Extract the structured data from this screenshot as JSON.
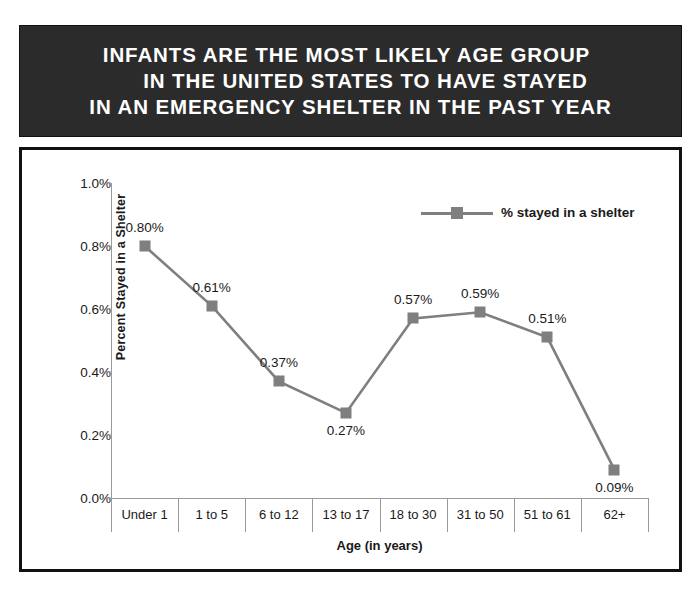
{
  "title": {
    "line1": "INFANTS ARE THE MOST LIKELY AGE GROUP",
    "line2": "IN THE UNITED STATES TO HAVE STAYED",
    "line3": "IN AN EMERGENCY SHELTER IN THE PAST YEAR",
    "background_color": "#2b2b2b",
    "text_color": "#ffffff"
  },
  "chart_data": {
    "type": "line",
    "title": "INFANTS ARE THE MOST LIKELY AGE GROUP IN THE UNITED STATES TO HAVE STAYED IN AN EMERGENCY SHELTER IN THE PAST YEAR",
    "xlabel": "Age (in years)",
    "ylabel": "Percent Stayed in a Shelter",
    "categories": [
      "Under 1",
      "1 to 5",
      "6 to 12",
      "13 to 17",
      "18 to 30",
      "31 to 50",
      "51 to 61",
      "62+"
    ],
    "values": [
      0.8,
      0.61,
      0.37,
      0.27,
      0.57,
      0.59,
      0.51,
      0.09
    ],
    "point_labels": [
      "0.80%",
      "0.61%",
      "0.37%",
      "0.27%",
      "0.57%",
      "0.59%",
      "0.51%",
      "0.09%"
    ],
    "label_positions": [
      "above",
      "above",
      "above",
      "below",
      "above",
      "above",
      "above",
      "below"
    ],
    "ylim": [
      0.0,
      1.0
    ],
    "ytick_values": [
      1.0,
      0.8,
      0.6,
      0.4,
      0.2,
      0.0
    ],
    "ytick_labels": [
      "1.0%",
      "0.8%",
      "0.6%",
      "0.4%",
      "0.2%",
      "0.0%"
    ],
    "grid": false,
    "legend_position": "top-right",
    "series": [
      {
        "name": "% stayed in a shelter",
        "values": [
          0.8,
          0.61,
          0.37,
          0.27,
          0.57,
          0.59,
          0.51,
          0.09
        ],
        "color": "#7f7f7f",
        "marker": "square"
      }
    ]
  },
  "legend": {
    "label": "% stayed in a shelter",
    "color": "#7f7f7f"
  },
  "colors": {
    "series": "#7f7f7f",
    "axis": "#9a9a9a",
    "frame": "#111111",
    "text": "#1a1a1a"
  }
}
